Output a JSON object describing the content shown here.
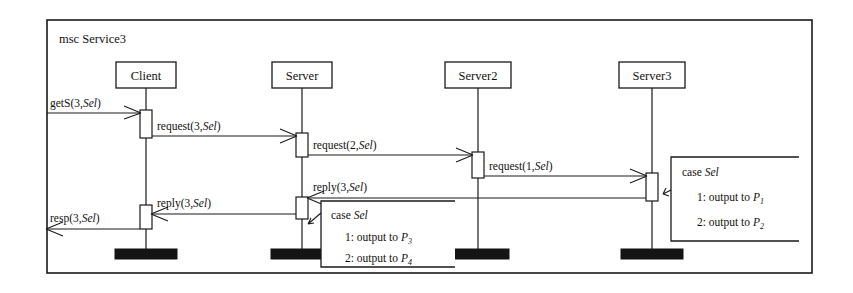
{
  "diagram": {
    "title": "msc Service3",
    "type": "message-sequence-chart",
    "instances": [
      {
        "name": "Client",
        "x": 146
      },
      {
        "name": "Server",
        "x": 302
      },
      {
        "name": "Server2",
        "x": 478
      },
      {
        "name": "Server3",
        "x": 652
      }
    ],
    "messages": [
      {
        "id": "m1",
        "label_main": "getS(3,",
        "label_ital": "Sel",
        "label_tail": ")",
        "from": "env",
        "to": "Client",
        "y": 113
      },
      {
        "id": "m2",
        "label_main": "request(3,",
        "label_ital": "Sel",
        "label_tail": ")",
        "from": "Client",
        "to": "Server",
        "y": 136
      },
      {
        "id": "m3",
        "label_main": "request(2,",
        "label_ital": "Sel",
        "label_tail": ")",
        "from": "Server",
        "to": "Server2",
        "y": 155
      },
      {
        "id": "m4",
        "label_main": "request(1,",
        "label_ital": "Sel",
        "label_tail": ")",
        "from": "Server2",
        "to": "Server3",
        "y": 176
      },
      {
        "id": "m5",
        "label_main": "reply(3,",
        "label_ital": "Sel",
        "label_tail": ")",
        "from": "Server3",
        "to": "Server",
        "y": 200
      },
      {
        "id": "m6",
        "label_main": "reply(3,",
        "label_ital": "Sel",
        "label_tail": ")",
        "from": "Server",
        "to": "Client",
        "y": 215
      },
      {
        "id": "m7",
        "label_main": "resp(3,",
        "label_ital": "Sel",
        "label_tail": ")",
        "from": "Client",
        "to": "env",
        "y": 228
      }
    ],
    "case_boxes": [
      {
        "id": "case-right",
        "header_main": "case ",
        "header_ital": "Sel",
        "lines": [
          {
            "prefix": "1: output to ",
            "symbol": "P",
            "subscript": "1"
          },
          {
            "prefix": "2: output to ",
            "symbol": "P",
            "subscript": "2"
          }
        ]
      },
      {
        "id": "case-left",
        "header_main": "case ",
        "header_ital": "Sel",
        "lines": [
          {
            "prefix": "1: output to ",
            "symbol": "P",
            "subscript": "3"
          },
          {
            "prefix": "2: output to ",
            "symbol": "P",
            "subscript": "4"
          }
        ]
      }
    ],
    "colors": {
      "stroke": "#1a1a1a",
      "fill": "#ffffff",
      "terminator": "#141414",
      "background": "#ffffff"
    }
  }
}
